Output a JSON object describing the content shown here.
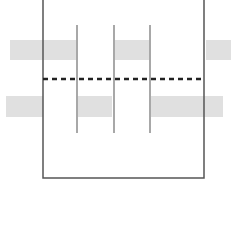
{
  "diagram": {
    "background": "#ffffff",
    "frame": {
      "x": 43,
      "y": -2,
      "width": 161,
      "height": 180,
      "stroke": "#555555",
      "stroke_width": 1.5
    },
    "dashed_line": {
      "x1": 43,
      "x2": 204,
      "y": 79,
      "stroke": "#222222",
      "stroke_width": 2.5,
      "dash": "5,4"
    },
    "dividers": [
      {
        "x": 77,
        "y1": 25,
        "y2": 133
      },
      {
        "x": 114,
        "y1": 25,
        "y2": 133
      },
      {
        "x": 150,
        "y1": 25,
        "y2": 133
      }
    ],
    "divider_color": "#a8a8a8",
    "block_color": "#e0e0e0",
    "top_row_blocks": [
      {
        "x": 10,
        "y": 40,
        "width": 67,
        "height": 20
      },
      {
        "x": 114,
        "y": 40,
        "width": 36,
        "height": 20
      },
      {
        "x": 206,
        "y": 40,
        "width": 25,
        "height": 20
      }
    ],
    "bottom_row_blocks": [
      {
        "x": 6,
        "y": 96,
        "width": 37,
        "height": 21
      },
      {
        "x": 78,
        "y": 96,
        "width": 34,
        "height": 21
      },
      {
        "x": 151,
        "y": 96,
        "width": 72,
        "height": 21
      }
    ]
  }
}
